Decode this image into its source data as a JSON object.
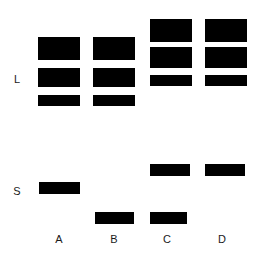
{
  "figure": {
    "type": "gel-electrophoresis-diagram",
    "width": 263,
    "height": 258,
    "background_color": "#ffffff",
    "band_color": "#000000",
    "label_color": "#1a1a1a"
  },
  "row_labels": [
    {
      "text": "L",
      "x": 10,
      "y": 74,
      "width": 14
    },
    {
      "text": "S",
      "x": 10,
      "y": 186,
      "width": 14
    }
  ],
  "lane_labels": [
    {
      "text": "A",
      "x": 45,
      "y": 234,
      "width": 28
    },
    {
      "text": "B",
      "x": 100,
      "y": 234,
      "width": 28
    },
    {
      "text": "C",
      "x": 153,
      "y": 234,
      "width": 28
    },
    {
      "text": "D",
      "x": 208,
      "y": 234,
      "width": 28
    }
  ],
  "bands": [
    {
      "lane": "A",
      "region": "L",
      "index": 1,
      "x": 38,
      "y": 37,
      "width": 42,
      "height": 23
    },
    {
      "lane": "A",
      "region": "L",
      "index": 2,
      "x": 38,
      "y": 68,
      "width": 42,
      "height": 19
    },
    {
      "lane": "A",
      "region": "L",
      "index": 3,
      "x": 38,
      "y": 95,
      "width": 42,
      "height": 11
    },
    {
      "lane": "A",
      "region": "S",
      "index": 1,
      "x": 39,
      "y": 182,
      "width": 41,
      "height": 12
    },
    {
      "lane": "B",
      "region": "L",
      "index": 1,
      "x": 93,
      "y": 37,
      "width": 42,
      "height": 23
    },
    {
      "lane": "B",
      "region": "L",
      "index": 2,
      "x": 93,
      "y": 68,
      "width": 42,
      "height": 19
    },
    {
      "lane": "B",
      "region": "L",
      "index": 3,
      "x": 93,
      "y": 95,
      "width": 42,
      "height": 11
    },
    {
      "lane": "B",
      "region": "S",
      "index": 1,
      "x": 95,
      "y": 212,
      "width": 39,
      "height": 12
    },
    {
      "lane": "C",
      "region": "L",
      "index": 1,
      "x": 150,
      "y": 19,
      "width": 42,
      "height": 23
    },
    {
      "lane": "C",
      "region": "L",
      "index": 2,
      "x": 150,
      "y": 47,
      "width": 42,
      "height": 21
    },
    {
      "lane": "C",
      "region": "L",
      "index": 3,
      "x": 150,
      "y": 75,
      "width": 42,
      "height": 11
    },
    {
      "lane": "C",
      "region": "S",
      "index": 1,
      "x": 150,
      "y": 164,
      "width": 40,
      "height": 12
    },
    {
      "lane": "C",
      "region": "S",
      "index": 2,
      "x": 150,
      "y": 212,
      "width": 37,
      "height": 12
    },
    {
      "lane": "D",
      "region": "L",
      "index": 1,
      "x": 205,
      "y": 19,
      "width": 42,
      "height": 23
    },
    {
      "lane": "D",
      "region": "L",
      "index": 2,
      "x": 205,
      "y": 47,
      "width": 42,
      "height": 21
    },
    {
      "lane": "D",
      "region": "L",
      "index": 3,
      "x": 205,
      "y": 75,
      "width": 42,
      "height": 11
    },
    {
      "lane": "D",
      "region": "S",
      "index": 1,
      "x": 205,
      "y": 164,
      "width": 40,
      "height": 12
    }
  ]
}
